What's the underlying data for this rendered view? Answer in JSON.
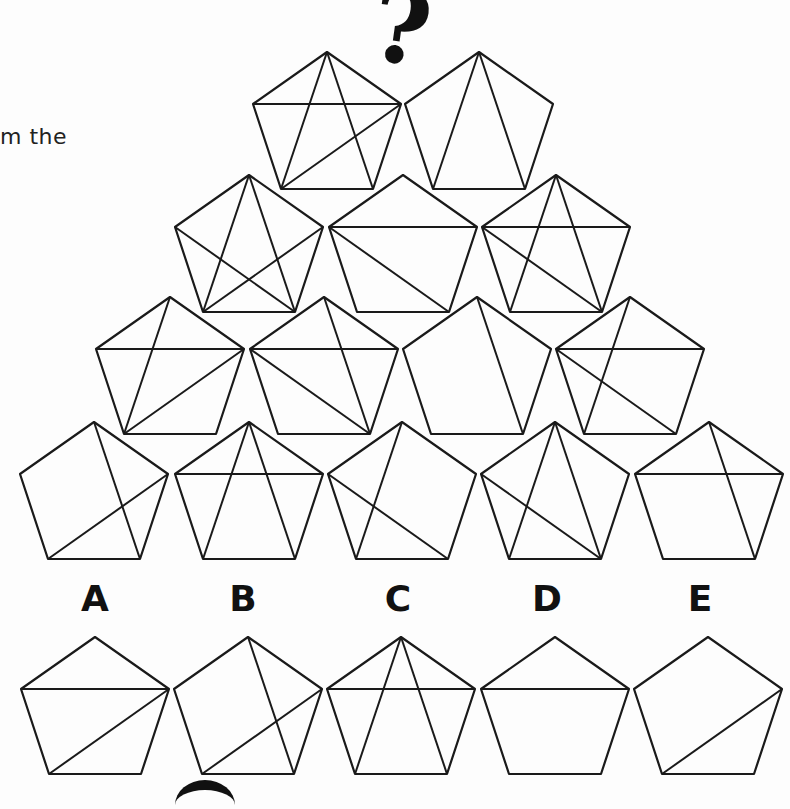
{
  "intro_text": "m the",
  "question_mark": "?",
  "pentagon_offsets": {
    "T": [
      0,
      0
    ],
    "UL": [
      -74,
      52
    ],
    "UR": [
      74,
      52
    ],
    "BL": [
      -46,
      137
    ],
    "BR": [
      46,
      137
    ]
  },
  "pyramid": {
    "rows": [
      [
        {
          "top": [
            327,
            52
          ],
          "diagonals": [
            [
              "T",
              "BL"
            ],
            [
              "T",
              "BR"
            ],
            [
              "UL",
              "UR"
            ],
            [
              "UR",
              "BL"
            ]
          ]
        },
        {
          "top": [
            479,
            52
          ],
          "diagonals": [
            [
              "T",
              "BL"
            ],
            [
              "T",
              "BR"
            ]
          ]
        }
      ],
      [
        {
          "top": [
            249,
            175
          ],
          "diagonals": [
            [
              "T",
              "BL"
            ],
            [
              "T",
              "BR"
            ],
            [
              "UL",
              "BR"
            ],
            [
              "UR",
              "BL"
            ]
          ]
        },
        {
          "top": [
            403,
            175
          ],
          "diagonals": [
            [
              "UL",
              "UR"
            ],
            [
              "UL",
              "BR"
            ]
          ]
        },
        {
          "top": [
            556,
            175
          ],
          "diagonals": [
            [
              "T",
              "BL"
            ],
            [
              "T",
              "BR"
            ],
            [
              "UL",
              "UR"
            ],
            [
              "UL",
              "BR"
            ]
          ]
        }
      ],
      [
        {
          "top": [
            170,
            297
          ],
          "diagonals": [
            [
              "T",
              "BL"
            ],
            [
              "UL",
              "UR"
            ],
            [
              "UR",
              "BL"
            ]
          ]
        },
        {
          "top": [
            324,
            297
          ],
          "diagonals": [
            [
              "T",
              "BR"
            ],
            [
              "UL",
              "UR"
            ],
            [
              "UL",
              "BR"
            ]
          ]
        },
        {
          "top": [
            477,
            297
          ],
          "diagonals": [
            [
              "T",
              "BR"
            ]
          ]
        },
        {
          "top": [
            630,
            297
          ],
          "diagonals": [
            [
              "T",
              "BL"
            ],
            [
              "UL",
              "UR"
            ],
            [
              "UL",
              "BR"
            ]
          ]
        }
      ],
      [
        {
          "top": [
            94,
            422
          ],
          "diagonals": [
            [
              "T",
              "BR"
            ],
            [
              "UR",
              "BL"
            ]
          ]
        },
        {
          "top": [
            249,
            422
          ],
          "diagonals": [
            [
              "T",
              "BL"
            ],
            [
              "T",
              "BR"
            ],
            [
              "UL",
              "UR"
            ]
          ]
        },
        {
          "top": [
            402,
            422
          ],
          "diagonals": [
            [
              "T",
              "BL"
            ],
            [
              "UL",
              "BR"
            ]
          ]
        },
        {
          "top": [
            555,
            422
          ],
          "diagonals": [
            [
              "T",
              "BL"
            ],
            [
              "T",
              "BR"
            ],
            [
              "UL",
              "BR"
            ]
          ]
        },
        {
          "top": [
            709,
            422
          ],
          "diagonals": [
            [
              "T",
              "BR"
            ],
            [
              "UL",
              "UR"
            ]
          ]
        }
      ]
    ]
  },
  "options": [
    {
      "label": "A",
      "label_x": 95,
      "top": [
        95,
        637
      ],
      "diagonals": [
        [
          "UL",
          "UR"
        ],
        [
          "UR",
          "BL"
        ]
      ]
    },
    {
      "label": "B",
      "label_x": 243,
      "top": [
        248,
        637
      ],
      "diagonals": [
        [
          "T",
          "BR"
        ],
        [
          "UR",
          "BL"
        ]
      ]
    },
    {
      "label": "C",
      "label_x": 398,
      "top": [
        401,
        637
      ],
      "diagonals": [
        [
          "T",
          "BL"
        ],
        [
          "T",
          "BR"
        ],
        [
          "UL",
          "UR"
        ]
      ]
    },
    {
      "label": "D",
      "label_x": 547,
      "top": [
        555,
        637
      ],
      "diagonals": [
        [
          "UL",
          "UR"
        ]
      ]
    },
    {
      "label": "E",
      "label_x": 700,
      "top": [
        708,
        637
      ],
      "diagonals": [
        [
          "UR",
          "BL"
        ]
      ]
    }
  ],
  "colors": {
    "stroke": "#1a1a1a",
    "background": "#fdfdfd"
  }
}
